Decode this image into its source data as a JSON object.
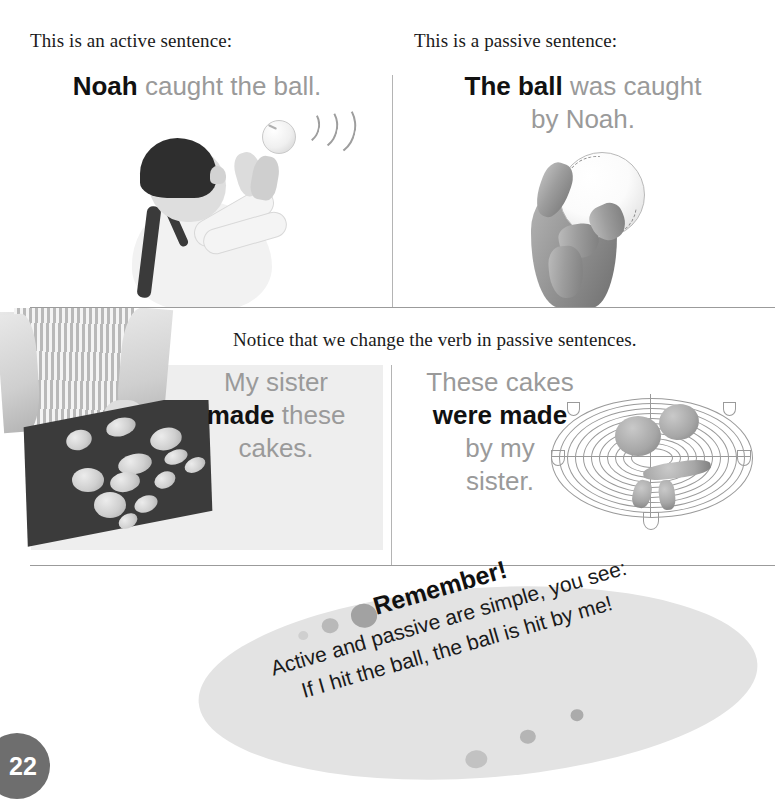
{
  "page": {
    "number": "22",
    "background_color": "#ffffff"
  },
  "top_left_panel": {
    "heading": "This is an active sentence:",
    "sentence": {
      "bold_part": "Noah",
      "rest": " caught the ball."
    },
    "image": {
      "name": "boy-catching-ball-photo",
      "alt": "Black and white photo of a boy looking up, hands raised, catching a ball with motion arcs"
    }
  },
  "top_right_panel": {
    "heading": "This is a passive sentence:",
    "sentence": {
      "bold_part": "The ball",
      "rest": " was caught",
      "line2": "by Noah."
    },
    "image": {
      "name": "hand-holding-baseball-photo",
      "alt": "Black and white photo of a hand holding a baseball"
    }
  },
  "middle_note": {
    "text": "Notice that we change the verb in passive sentences."
  },
  "bottom_left_panel": {
    "sentence": {
      "line1": "My sister",
      "bold_part": "made",
      "line2_rest": " these",
      "line3": "cakes."
    },
    "image": {
      "name": "baking-tray-with-dough-photo",
      "alt": "Black and white photo of hands placing dough shapes on a dark baking tray"
    },
    "panel_color": "#eeeeee"
  },
  "bottom_right_panel": {
    "sentence": {
      "line1": "These cakes",
      "bold_part": "were made",
      "line3": "by my",
      "line4": "sister."
    },
    "image": {
      "name": "wire-cooling-rack-photo",
      "alt": "Black and white photo of a round wire cooling rack holding baked cakes"
    }
  },
  "remember_callout": {
    "title": "Remember!",
    "line1": "Active and passive are simple, you see:",
    "line2": "If I hit the ball, the ball is hit by me!",
    "background_color": "#e3e3e3",
    "dot_color": "#adadad"
  },
  "colors": {
    "text_dark": "#111111",
    "text_gray": "#9a9a9a",
    "divider": "#9b9b9b",
    "badge": "#6e6e6e"
  }
}
